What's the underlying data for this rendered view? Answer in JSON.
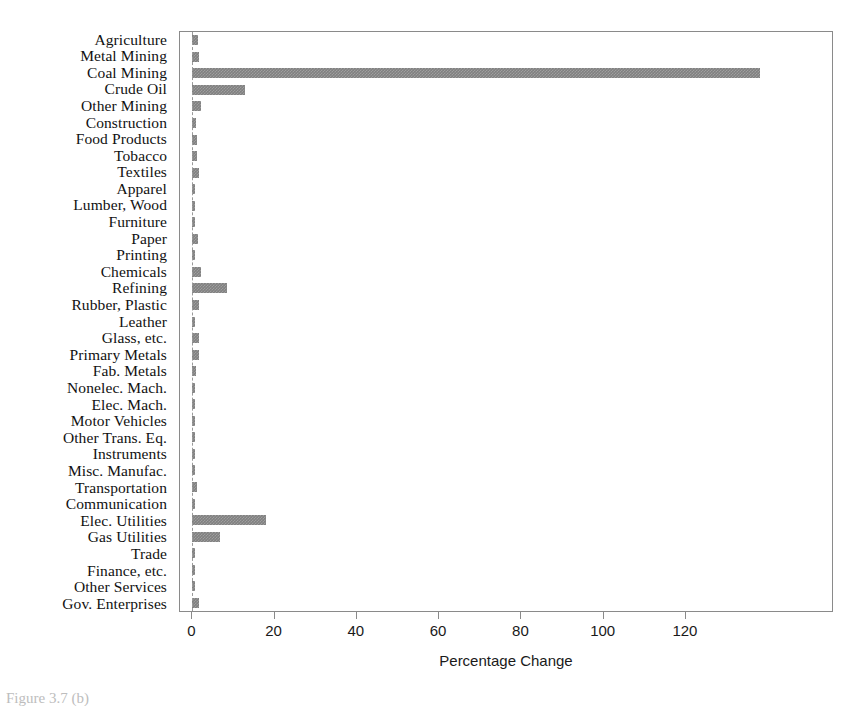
{
  "chart_data": {
    "type": "bar",
    "orientation": "horizontal",
    "title": "",
    "xlabel": "Percentage Change",
    "ylabel": "",
    "xlim": [
      -3,
      156
    ],
    "xticks": [
      0,
      20,
      40,
      60,
      80,
      100,
      120
    ],
    "xticklabels": [
      "0",
      "20",
      "40",
      "60",
      "80",
      "100",
      "120"
    ],
    "grid": false,
    "legend": null,
    "bar_color": "#808080",
    "zero_line": 0,
    "categories": [
      "Agriculture",
      "Metal Mining",
      "Coal Mining",
      "Crude Oil",
      "Other Mining",
      "Construction",
      "Food Products",
      "Tobacco",
      "Textiles",
      "Apparel",
      "Lumber, Wood",
      "Furniture",
      "Paper",
      "Printing",
      "Chemicals",
      "Refining",
      "Rubber, Plastic",
      "Leather",
      "Glass, etc.",
      "Primary Metals",
      "Fab. Metals",
      "Nonelec. Mach.",
      "Elec. Mach.",
      "Motor Vehicles",
      "Other Trans. Eq.",
      "Instruments",
      "Misc. Manufac.",
      "Transportation",
      "Communication",
      "Elec. Utilities",
      "Gas Utilities",
      "Trade",
      "Finance, etc.",
      "Other Services",
      "Gov. Enterprises"
    ],
    "values": [
      1.4,
      1.6,
      138.0,
      12.7,
      2.2,
      0.9,
      1.2,
      1.1,
      1.7,
      0.5,
      0.4,
      0.5,
      1.5,
      0.4,
      2.0,
      8.5,
      1.7,
      0.3,
      1.6,
      1.7,
      0.9,
      0.6,
      0.5,
      0.5,
      0.7,
      0.4,
      0.5,
      1.1,
      0.4,
      17.8,
      6.8,
      0.6,
      0.3,
      0.4,
      1.6
    ]
  },
  "caption": {
    "text": "Figure 3.7 (b)"
  }
}
